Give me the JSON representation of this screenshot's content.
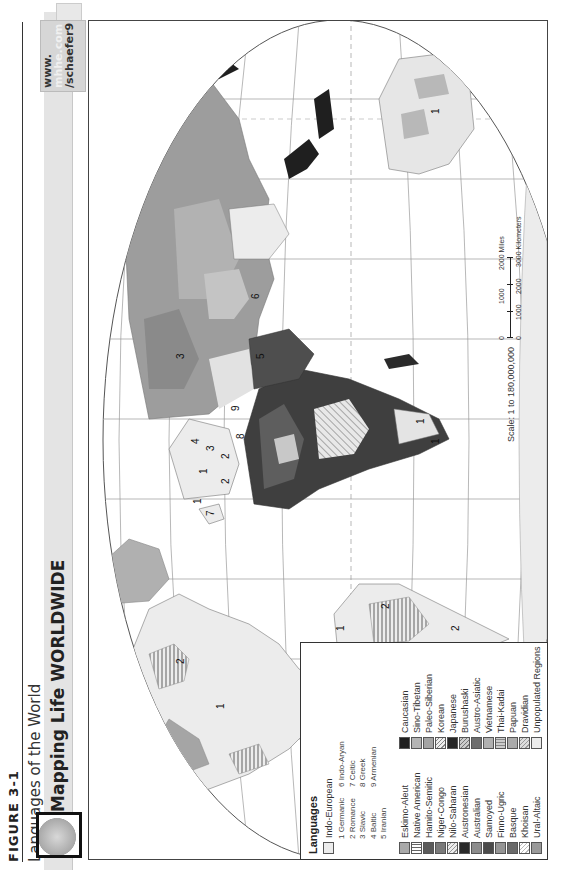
{
  "figure": {
    "label": "FIGURE 3-1",
    "subtitle": "Languages of the World"
  },
  "banner": {
    "title": "Mapping Life WORLDWIDE",
    "url_line1": "www.",
    "url_line2": "mhhe.com",
    "url_line3": "/schaefer9",
    "globe_icon": "globe-icon"
  },
  "map": {
    "projection_note": "World map, Robinson-style projection, rotated 90° on page",
    "region_labels": [
      {
        "text": "1",
        "where": "North America"
      },
      {
        "text": "2",
        "where": "Mexico / Central America"
      },
      {
        "text": "2",
        "where": "Quebec"
      },
      {
        "text": "1",
        "where": "Caribbean"
      },
      {
        "text": "2",
        "where": "Brazil"
      },
      {
        "text": "2",
        "where": "South America (south)"
      },
      {
        "text": "7",
        "where": "Ireland"
      },
      {
        "text": "1",
        "where": "British Isles"
      },
      {
        "text": "2",
        "where": "Iberia / France"
      },
      {
        "text": "1",
        "where": "Central Europe"
      },
      {
        "text": "2",
        "where": "Italy"
      },
      {
        "text": "3",
        "where": "Poland"
      },
      {
        "text": "4",
        "where": "Baltic"
      },
      {
        "text": "8",
        "where": "Greece"
      },
      {
        "text": "9",
        "where": "Armenia"
      },
      {
        "text": "3",
        "where": "Russia"
      },
      {
        "text": "5",
        "where": "Iran"
      },
      {
        "text": "6",
        "where": "India"
      },
      {
        "text": "1",
        "where": "South Africa (west)"
      },
      {
        "text": "1",
        "where": "South Africa (east)"
      },
      {
        "text": "1",
        "where": "Australia"
      }
    ]
  },
  "legend": {
    "title": "Languages",
    "indo_european": {
      "label": "Indo-European",
      "subgroups_left": [
        "1  Germanic",
        "2  Romance",
        "3  Slavic",
        "4  Baltic",
        "5  Iranian"
      ],
      "subgroups_right": [
        "6  Indo-Aryan",
        "7  Celtic",
        "8  Greek",
        "9  Armenian"
      ]
    },
    "col1": [
      {
        "label": "Eskimo-Aleut",
        "swatch": "#a9a9a9",
        "pattern": "solid"
      },
      {
        "label": "Native American",
        "swatch": "#ffffff",
        "pattern": "vertical-lines"
      },
      {
        "label": "Hamito-Semitic",
        "swatch": "#5a5a5a",
        "pattern": "solid"
      },
      {
        "label": "Niger-Congo",
        "swatch": "#7a7a7a",
        "pattern": "solid"
      },
      {
        "label": "Nilo-Saharan",
        "swatch": "#e6e6e6",
        "pattern": "diagonal-lines"
      },
      {
        "label": "Austronesian",
        "swatch": "#2a2a2a",
        "pattern": "solid"
      },
      {
        "label": "Australian",
        "swatch": "#8c8c8c",
        "pattern": "solid"
      },
      {
        "label": "Samoyed",
        "swatch": "#4a4a4a",
        "pattern": "solid"
      },
      {
        "label": "Finno-Ugric",
        "swatch": "#959595",
        "pattern": "solid"
      },
      {
        "label": "Basque",
        "swatch": "#6a6a6a",
        "pattern": "solid"
      },
      {
        "label": "Khoisan",
        "swatch": "#ffffff",
        "pattern": "diagonal-lines"
      },
      {
        "label": "Ural-Altaic",
        "swatch": "#9a9a9a",
        "pattern": "solid"
      }
    ],
    "col2": [
      {
        "label": "Caucasian",
        "swatch": "#1f1f1f",
        "pattern": "solid"
      },
      {
        "label": "Sino-Tibetan",
        "swatch": "#b4b4b4",
        "pattern": "solid"
      },
      {
        "label": "Paleo-Siberian",
        "swatch": "#a4a4a4",
        "pattern": "solid"
      },
      {
        "label": "Korean",
        "swatch": "#e0e0e0",
        "pattern": "diagonal-lines"
      },
      {
        "label": "Japanese",
        "swatch": "#262626",
        "pattern": "solid"
      },
      {
        "label": "Burushaski",
        "swatch": "#bdbdbd",
        "pattern": "diagonal-lines"
      },
      {
        "label": "Austro-Asiatic",
        "swatch": "#6e6e6e",
        "pattern": "solid"
      },
      {
        "label": "Vietnamese",
        "swatch": "#b0b0b0",
        "pattern": "solid"
      },
      {
        "label": "Thai-Kadai",
        "swatch": "#c4c4c4",
        "pattern": "vertical-lines"
      },
      {
        "label": "Papuan",
        "swatch": "#aaaaaa",
        "pattern": "solid"
      },
      {
        "label": "Dravidian",
        "swatch": "#cfcfcf",
        "pattern": "diagonal-lines"
      },
      {
        "label": "Unpopulated Regions",
        "swatch": "#ebebeb",
        "pattern": "solid"
      }
    ]
  },
  "scale": {
    "text": "Scale: 1 to 180,000,000",
    "miles_ticks": [
      "0",
      "1000",
      "2000 Miles"
    ],
    "km_ticks": [
      "0",
      "1000",
      "2000",
      "3000 Kilometers"
    ]
  }
}
